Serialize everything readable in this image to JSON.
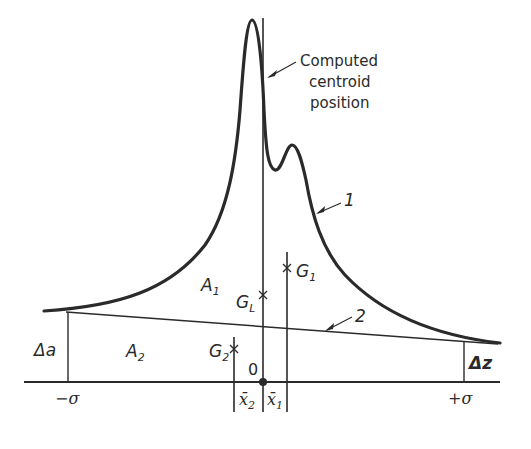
{
  "figure": {
    "type": "diagram",
    "colors": {
      "ink": "#2a2a2a",
      "background": "#ffffff"
    },
    "callout": {
      "line1": "Computed",
      "line2": "centroid",
      "line3": "position"
    },
    "curve_labels": {
      "curve": "1",
      "baseline": "2"
    },
    "areas": {
      "a1": {
        "main": "A",
        "sub": "1"
      },
      "a2": {
        "main": "A",
        "sub": "2"
      }
    },
    "centroids": {
      "g1": {
        "main": "G",
        "sub": "1"
      },
      "gl": {
        "main": "G",
        "sub": "L"
      },
      "g2": {
        "main": "G",
        "sub": "2"
      }
    },
    "side_labels": {
      "delta_a": "Δa",
      "delta_z": "Δz"
    },
    "axis": {
      "origin": "0",
      "left_limit": "−σ",
      "right_limit": "+σ",
      "x2": {
        "main": "x̄",
        "sub": "2"
      },
      "x1": {
        "main": "x̄",
        "sub": "1"
      }
    }
  }
}
